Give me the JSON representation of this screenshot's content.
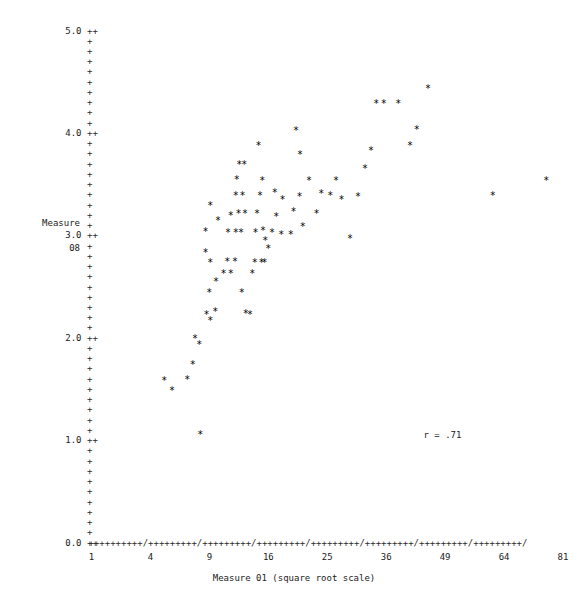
{
  "chart_data": {
    "type": "scatter",
    "title": "",
    "xlabel": "Measure 01 (square root scale)",
    "ylabel_line1": "Measure",
    "ylabel_line2": "08",
    "annotation": "r = .71",
    "marker": "*",
    "grid": false,
    "legend": "none",
    "xscale": "sqrt",
    "xlim": [
      1,
      81
    ],
    "ylim": [
      0.0,
      5.0
    ],
    "xticks": [
      1,
      4,
      9,
      16,
      25,
      36,
      49,
      64,
      81
    ],
    "xtick_labels": [
      "1",
      "4",
      "9",
      "16",
      "25",
      "36",
      "49",
      "64",
      "81"
    ],
    "yticks": [
      0.0,
      1.0,
      2.0,
      3.0,
      4.0,
      5.0
    ],
    "ytick_labels": [
      "0.0",
      "1.0",
      "2.0",
      "3.0",
      "4.0",
      "5.0"
    ],
    "y_minor_count_between": 9,
    "axis_char": "+",
    "axis_tick_char": "/",
    "points": [
      {
        "x": 5.0,
        "y": 1.61
      },
      {
        "x": 5.6,
        "y": 1.51
      },
      {
        "x": 6.9,
        "y": 1.62
      },
      {
        "x": 7.4,
        "y": 1.77
      },
      {
        "x": 8.1,
        "y": 1.08
      },
      {
        "x": 7.6,
        "y": 2.02
      },
      {
        "x": 8.0,
        "y": 1.96
      },
      {
        "x": 8.7,
        "y": 2.26
      },
      {
        "x": 9.1,
        "y": 2.2
      },
      {
        "x": 9.6,
        "y": 2.29
      },
      {
        "x": 9.0,
        "y": 2.47
      },
      {
        "x": 9.7,
        "y": 2.58
      },
      {
        "x": 8.6,
        "y": 2.86
      },
      {
        "x": 9.1,
        "y": 2.76
      },
      {
        "x": 8.6,
        "y": 3.07
      },
      {
        "x": 9.9,
        "y": 3.17
      },
      {
        "x": 9.1,
        "y": 3.32
      },
      {
        "x": 10.5,
        "y": 2.66
      },
      {
        "x": 10.9,
        "y": 2.77
      },
      {
        "x": 11.3,
        "y": 2.66
      },
      {
        "x": 11.8,
        "y": 2.77
      },
      {
        "x": 12.6,
        "y": 2.47
      },
      {
        "x": 11.0,
        "y": 3.06
      },
      {
        "x": 11.9,
        "y": 3.06
      },
      {
        "x": 12.5,
        "y": 3.06
      },
      {
        "x": 11.3,
        "y": 3.22
      },
      {
        "x": 12.2,
        "y": 3.24
      },
      {
        "x": 13.0,
        "y": 3.24
      },
      {
        "x": 11.9,
        "y": 3.42
      },
      {
        "x": 12.7,
        "y": 3.42
      },
      {
        "x": 12.0,
        "y": 3.57
      },
      {
        "x": 12.3,
        "y": 3.72
      },
      {
        "x": 12.9,
        "y": 3.72
      },
      {
        "x": 13.1,
        "y": 2.27
      },
      {
        "x": 13.6,
        "y": 2.26
      },
      {
        "x": 13.9,
        "y": 2.66
      },
      {
        "x": 14.2,
        "y": 2.76
      },
      {
        "x": 15.1,
        "y": 2.76
      },
      {
        "x": 15.5,
        "y": 2.76
      },
      {
        "x": 14.3,
        "y": 3.06
      },
      {
        "x": 15.6,
        "y": 2.98
      },
      {
        "x": 14.5,
        "y": 3.24
      },
      {
        "x": 15.3,
        "y": 3.08
      },
      {
        "x": 14.9,
        "y": 3.42
      },
      {
        "x": 15.2,
        "y": 3.56
      },
      {
        "x": 14.7,
        "y": 3.91
      },
      {
        "x": 16.0,
        "y": 2.9
      },
      {
        "x": 16.9,
        "y": 3.45
      },
      {
        "x": 17.1,
        "y": 3.21
      },
      {
        "x": 16.5,
        "y": 3.06
      },
      {
        "x": 17.8,
        "y": 3.04
      },
      {
        "x": 18.0,
        "y": 3.38
      },
      {
        "x": 19.2,
        "y": 3.04
      },
      {
        "x": 19.6,
        "y": 3.26
      },
      {
        "x": 20.5,
        "y": 3.41
      },
      {
        "x": 21.0,
        "y": 3.12
      },
      {
        "x": 20.0,
        "y": 4.05
      },
      {
        "x": 20.6,
        "y": 3.82
      },
      {
        "x": 22.0,
        "y": 3.56
      },
      {
        "x": 23.2,
        "y": 3.24
      },
      {
        "x": 24.0,
        "y": 3.44
      },
      {
        "x": 25.5,
        "y": 3.42
      },
      {
        "x": 26.5,
        "y": 3.56
      },
      {
        "x": 27.5,
        "y": 3.38
      },
      {
        "x": 29.0,
        "y": 3.0
      },
      {
        "x": 30.5,
        "y": 3.41
      },
      {
        "x": 31.8,
        "y": 3.68
      },
      {
        "x": 33.0,
        "y": 3.86
      },
      {
        "x": 34.0,
        "y": 4.32
      },
      {
        "x": 35.5,
        "y": 4.32
      },
      {
        "x": 38.5,
        "y": 4.32
      },
      {
        "x": 41.0,
        "y": 3.91
      },
      {
        "x": 42.5,
        "y": 4.06
      },
      {
        "x": 45.0,
        "y": 4.46
      },
      {
        "x": 61.0,
        "y": 3.42
      },
      {
        "x": 76.0,
        "y": 3.56
      }
    ]
  }
}
